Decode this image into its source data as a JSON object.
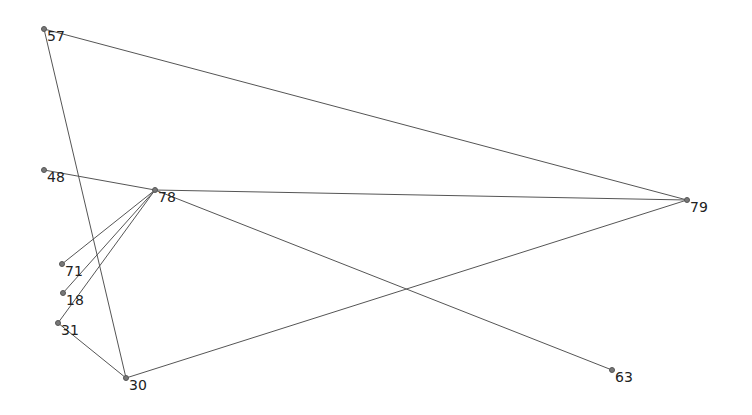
{
  "chart_data": {
    "type": "network",
    "nodes": [
      {
        "id": "57",
        "label": "57",
        "x": 44,
        "y": 29
      },
      {
        "id": "48",
        "label": "48",
        "x": 44,
        "y": 170
      },
      {
        "id": "78",
        "label": "78",
        "x": 155,
        "y": 190
      },
      {
        "id": "79",
        "label": "79",
        "x": 687,
        "y": 200
      },
      {
        "id": "71",
        "label": "71",
        "x": 62,
        "y": 264
      },
      {
        "id": "18",
        "label": "18",
        "x": 63,
        "y": 293
      },
      {
        "id": "31",
        "label": "31",
        "x": 58,
        "y": 323
      },
      {
        "id": "30",
        "label": "30",
        "x": 126,
        "y": 378
      },
      {
        "id": "63",
        "label": "63",
        "x": 612,
        "y": 370
      }
    ],
    "edges": [
      [
        "57",
        "79"
      ],
      [
        "57",
        "30"
      ],
      [
        "48",
        "78"
      ],
      [
        "78",
        "79"
      ],
      [
        "78",
        "63"
      ],
      [
        "78",
        "71"
      ],
      [
        "78",
        "18"
      ],
      [
        "78",
        "31"
      ],
      [
        "31",
        "30"
      ],
      [
        "30",
        "79"
      ]
    ]
  },
  "style": {
    "edge_color": "#555555",
    "node_color": "#777777",
    "label_color": "#222222"
  }
}
